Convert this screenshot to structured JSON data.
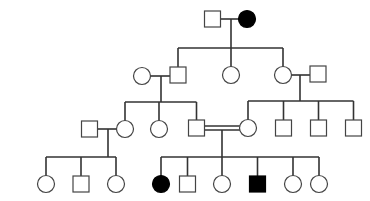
{
  "diagram": {
    "type": "pedigree",
    "colors": {
      "line": "#333333",
      "unaffected_fill": "#ffffff",
      "affected_fill": "#000000"
    },
    "symbol_size": 16,
    "individuals": [
      {
        "id": "I-1",
        "generation": 1,
        "sex": "male",
        "affected": false,
        "x": 212.5,
        "y": 19
      },
      {
        "id": "I-2",
        "generation": 1,
        "sex": "female",
        "affected": true,
        "x": 247,
        "y": 19
      },
      {
        "id": "II-1",
        "generation": 2,
        "sex": "female",
        "affected": false,
        "x": 142,
        "y": 76
      },
      {
        "id": "II-2",
        "generation": 2,
        "sex": "male",
        "affected": false,
        "x": 178,
        "y": 75
      },
      {
        "id": "II-3",
        "generation": 2,
        "sex": "female",
        "affected": false,
        "x": 231,
        "y": 75
      },
      {
        "id": "II-4",
        "generation": 2,
        "sex": "female",
        "affected": false,
        "x": 283,
        "y": 75
      },
      {
        "id": "II-5",
        "generation": 2,
        "sex": "male",
        "affected": false,
        "x": 318,
        "y": 74
      },
      {
        "id": "III-1",
        "generation": 3,
        "sex": "male",
        "affected": false,
        "x": 89.5,
        "y": 129
      },
      {
        "id": "III-2",
        "generation": 3,
        "sex": "female",
        "affected": false,
        "x": 125,
        "y": 129
      },
      {
        "id": "III-3",
        "generation": 3,
        "sex": "female",
        "affected": false,
        "x": 159,
        "y": 129
      },
      {
        "id": "III-4",
        "generation": 3,
        "sex": "male",
        "affected": false,
        "x": 196.5,
        "y": 128
      },
      {
        "id": "III-5",
        "generation": 3,
        "sex": "female",
        "affected": false,
        "x": 248,
        "y": 128
      },
      {
        "id": "III-6",
        "generation": 3,
        "sex": "male",
        "affected": false,
        "x": 283.5,
        "y": 128
      },
      {
        "id": "III-7",
        "generation": 3,
        "sex": "male",
        "affected": false,
        "x": 318.5,
        "y": 128
      },
      {
        "id": "III-8",
        "generation": 3,
        "sex": "male",
        "affected": false,
        "x": 353.5,
        "y": 128
      },
      {
        "id": "IV-1",
        "generation": 4,
        "sex": "female",
        "affected": false,
        "x": 46,
        "y": 184
      },
      {
        "id": "IV-2",
        "generation": 4,
        "sex": "male",
        "affected": false,
        "x": 81,
        "y": 184
      },
      {
        "id": "IV-3",
        "generation": 4,
        "sex": "female",
        "affected": false,
        "x": 116,
        "y": 184
      },
      {
        "id": "IV-4",
        "generation": 4,
        "sex": "female",
        "affected": true,
        "x": 161,
        "y": 184
      },
      {
        "id": "IV-5",
        "generation": 4,
        "sex": "male",
        "affected": false,
        "x": 187.5,
        "y": 184
      },
      {
        "id": "IV-6",
        "generation": 4,
        "sex": "female",
        "affected": false,
        "x": 222,
        "y": 184
      },
      {
        "id": "IV-7",
        "generation": 4,
        "sex": "male",
        "affected": true,
        "x": 257.5,
        "y": 184
      },
      {
        "id": "IV-8",
        "generation": 4,
        "sex": "female",
        "affected": false,
        "x": 293,
        "y": 184
      },
      {
        "id": "IV-9",
        "generation": 4,
        "sex": "female",
        "affected": false,
        "x": 319,
        "y": 184
      }
    ],
    "matings": [
      {
        "partners": [
          "I-1",
          "I-2"
        ],
        "consanguineous": false,
        "line": [
          220.5,
          19,
          239,
          19
        ],
        "drop": [
          231,
          19,
          231,
          48
        ]
      },
      {
        "partners": [
          "II-1",
          "II-2"
        ],
        "consanguineous": false,
        "line": [
          150,
          76,
          170,
          76
        ],
        "drop": [
          161,
          76,
          161,
          102
        ]
      },
      {
        "partners": [
          "II-4",
          "II-5"
        ],
        "consanguineous": false,
        "line": [
          291,
          75,
          310,
          75
        ],
        "drop": [
          300,
          75,
          300,
          101
        ]
      },
      {
        "partners": [
          "III-1",
          "III-2"
        ],
        "consanguineous": false,
        "line": [
          97.5,
          129,
          117,
          129
        ],
        "drop": [
          108,
          129,
          108,
          157
        ]
      },
      {
        "partners": [
          "III-4",
          "III-5"
        ],
        "consanguineous": true,
        "line": [
          204.5,
          126,
          240,
          126
        ],
        "line2": [
          204.5,
          130,
          240,
          130
        ],
        "drop": [
          222,
          130,
          222,
          157
        ]
      }
    ],
    "sibships": [
      {
        "parents": "I",
        "bar": [
          178,
          48,
          283,
          48
        ],
        "children": [
          {
            "x": 178,
            "top": 67
          },
          {
            "x": 231,
            "top": 67
          },
          {
            "x": 283,
            "top": 67
          }
        ]
      },
      {
        "parents": "II-1xII-2",
        "bar": [
          125,
          102,
          196.5,
          102
        ],
        "children": [
          {
            "x": 125,
            "top": 121
          },
          {
            "x": 159,
            "top": 121
          },
          {
            "x": 196.5,
            "top": 120
          }
        ]
      },
      {
        "parents": "II-4xII-5",
        "bar": [
          248,
          101,
          353.5,
          101
        ],
        "children": [
          {
            "x": 248,
            "top": 120
          },
          {
            "x": 283.5,
            "top": 120
          },
          {
            "x": 318.5,
            "top": 120
          },
          {
            "x": 353.5,
            "top": 120
          }
        ]
      },
      {
        "parents": "III-1xIII-2",
        "bar": [
          46,
          157,
          116,
          157
        ],
        "children": [
          {
            "x": 46,
            "top": 176
          },
          {
            "x": 81,
            "top": 176
          },
          {
            "x": 116,
            "top": 176
          }
        ]
      },
      {
        "parents": "III-4xIII-5",
        "bar": [
          161,
          157,
          319,
          157
        ],
        "children": [
          {
            "x": 161,
            "top": 176
          },
          {
            "x": 187.5,
            "top": 176
          },
          {
            "x": 222,
            "top": 176
          },
          {
            "x": 257.5,
            "top": 176
          },
          {
            "x": 293,
            "top": 176
          },
          {
            "x": 319,
            "top": 176
          }
        ]
      }
    ]
  }
}
